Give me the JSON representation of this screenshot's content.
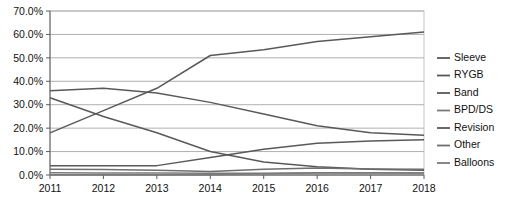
{
  "chart_data": {
    "type": "line",
    "title": "",
    "xlabel": "",
    "ylabel": "",
    "categories": [
      "2011",
      "2012",
      "2013",
      "2014",
      "2015",
      "2016",
      "2017",
      "2018"
    ],
    "x": [
      2011,
      2012,
      2013,
      2014,
      2015,
      2016,
      2017,
      2018
    ],
    "ylim": [
      0,
      70
    ],
    "ytick_values": [
      0,
      10,
      20,
      30,
      40,
      50,
      60,
      70
    ],
    "ytick_labels": [
      "0.0%",
      "10.0%",
      "20.0%",
      "30.0%",
      "40.0%",
      "50.0%",
      "60.0%",
      "70.0%"
    ],
    "grid": true,
    "legend_position": "right",
    "series": [
      {
        "name": "Sleeve",
        "color": "#595959",
        "values": [
          18.0,
          27.5,
          37.0,
          51.0,
          53.5,
          57.0,
          59.0,
          61.0
        ]
      },
      {
        "name": "RYGB",
        "color": "#595959",
        "values": [
          36.0,
          37.0,
          35.0,
          31.0,
          26.0,
          21.0,
          18.0,
          17.0
        ]
      },
      {
        "name": "Band",
        "color": "#595959",
        "values": [
          33.0,
          25.0,
          18.0,
          10.0,
          5.5,
          3.5,
          2.5,
          2.0
        ]
      },
      {
        "name": "BPD/DS",
        "color": "#7a7a7a",
        "values": [
          1.0,
          0.9,
          0.9,
          0.8,
          0.8,
          0.9,
          0.9,
          0.9
        ]
      },
      {
        "name": "Revision",
        "color": "#595959",
        "values": [
          4.0,
          4.0,
          4.0,
          7.5,
          11.0,
          13.5,
          14.5,
          15.0
        ]
      },
      {
        "name": "Other",
        "color": "#6e6e6e",
        "values": [
          2.5,
          2.3,
          2.0,
          1.5,
          2.5,
          3.0,
          2.6,
          2.5
        ]
      },
      {
        "name": "Balloons",
        "color": "#7a7a7a",
        "values": [
          0.1,
          0.1,
          0.1,
          0.1,
          0.5,
          1.0,
          1.0,
          0.9
        ]
      }
    ],
    "legend_entries": [
      "Sleeve",
      "RYGB",
      "Band",
      "BPD/DS",
      "Revision",
      "Other",
      "Balloons"
    ]
  },
  "layout": {
    "plot_left": 50,
    "plot_right": 424,
    "plot_top": 11,
    "plot_bottom": 175,
    "legend_x": 437,
    "legend_top": 58,
    "legend_step": 17.5
  }
}
